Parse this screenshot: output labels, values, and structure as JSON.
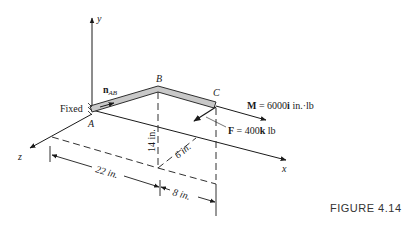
{
  "figure": {
    "caption": "FIGURE 4.14",
    "axes": {
      "x": "x",
      "y": "y",
      "z": "z"
    },
    "points": {
      "A": "A",
      "B": "B",
      "C": "C"
    },
    "support_label": "Fixed",
    "unit_vector": {
      "base": "n",
      "sub": "AB"
    },
    "moment": {
      "bold": "M",
      "text": " = 6000",
      "unit_bold": "i",
      "tail": " in.·lb"
    },
    "force": {
      "bold": "F",
      "text": " = 400",
      "unit_bold": "k",
      "tail": " lb"
    },
    "dimensions": {
      "height": "14 in.",
      "depth": "6 in.",
      "length_ab": "22 in.",
      "length_bc": "8 in."
    },
    "colors": {
      "member_fill": "#c8c8c8",
      "line": "#1a1a1a"
    }
  }
}
